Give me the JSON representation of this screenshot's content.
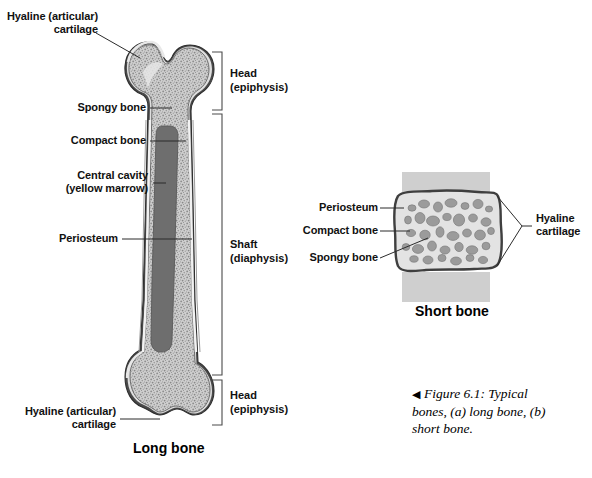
{
  "figure": {
    "caption_marker": "◀",
    "caption_text": "Figure 6.1: Typical bones, (a) long bone, (b) short bone."
  },
  "long_bone": {
    "title": "Long bone",
    "labels": {
      "hyaline_top": "Hyaline (articular)\ncartilage",
      "spongy": "Spongy bone",
      "compact": "Compact bone",
      "central_cavity": "Central cavity\n(yellow marrow)",
      "periosteum": "Periosteum",
      "hyaline_bottom": "Hyaline (articular)\ncartilage"
    },
    "brackets": {
      "head_top": "Head\n(epiphysis)",
      "shaft": "Shaft\n(diaphysis)",
      "head_bottom": "Head\n(epiphysis)"
    }
  },
  "short_bone": {
    "title": "Short bone",
    "labels": {
      "periosteum": "Periosteum",
      "compact": "Compact bone",
      "spongy": "Spongy bone",
      "hyaline": "Hyaline\ncartilage"
    }
  },
  "colors": {
    "background": "#ffffff",
    "outline": "#3a3a3a",
    "periosteum_dark": "#4a4a4a",
    "compact_bone": "#d8d8d8",
    "spongy_fill": "#b9b9b9",
    "marrow_cavity": "#6e6e6e",
    "cartilage_band": "#c9c9c9",
    "leader_line": "#2b2b2b",
    "text": "#111111"
  }
}
